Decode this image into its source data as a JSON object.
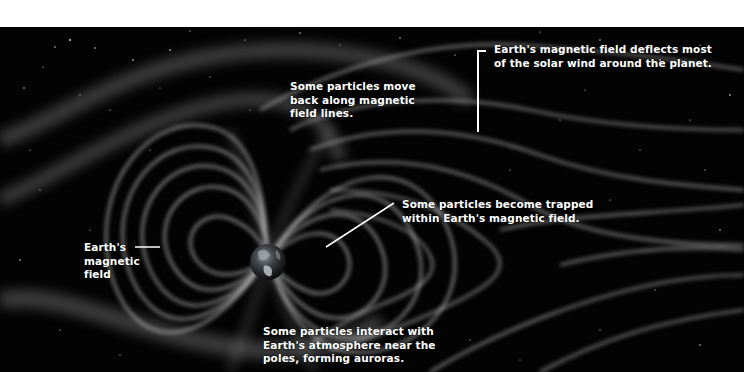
{
  "diagram": {
    "colors": {
      "background_space": "#030303",
      "top_band": "#ffffff",
      "field_lines": "#bdbdbd",
      "label_text": "#ffffff"
    },
    "annotations": {
      "deflects": "Earth's magnetic field deflects most\nof the solar wind around the planet.",
      "move_back": "Some particles move\nback along magnetic\nfield lines.",
      "trapped": "Some particles become trapped\nwithin Earth's magnetic field.",
      "magnetic_field": "Earth's\nmagnetic\nfield",
      "auroras": "Some particles interact with\nEarth's atmosphere near the\npoles, forming auroras."
    }
  }
}
